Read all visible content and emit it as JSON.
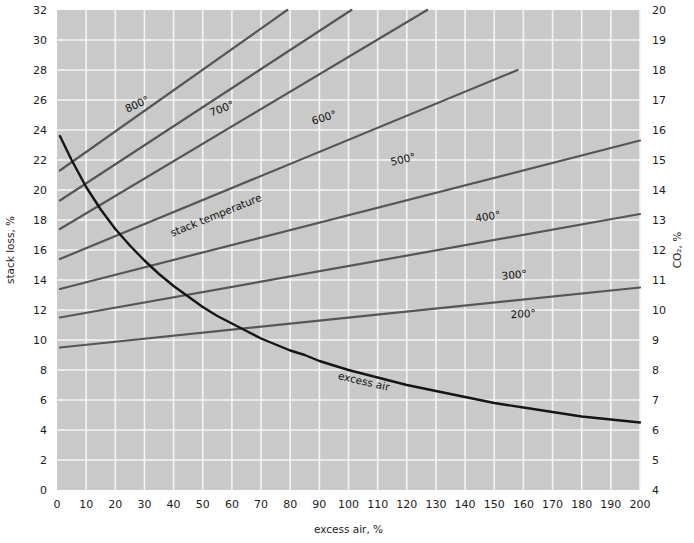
{
  "chart_data": {
    "type": "line",
    "title": "",
    "xlabel": "excess air, %",
    "ylabel": "stack loss, %",
    "y2label": "CO₂, %",
    "xlim": [
      0,
      200
    ],
    "ylim": [
      0,
      32
    ],
    "y2lim": [
      4,
      20
    ],
    "grid": true,
    "legend": "none",
    "background_color": "#c9c9c9",
    "grid_color": "#f4f4f4",
    "series_color": "#565656",
    "curve_color": "#151515",
    "xticks": [
      0,
      10,
      20,
      30,
      40,
      50,
      60,
      70,
      80,
      90,
      100,
      110,
      120,
      130,
      140,
      150,
      160,
      170,
      180,
      190,
      200
    ],
    "yticks": [
      0,
      2,
      4,
      6,
      8,
      10,
      12,
      14,
      16,
      18,
      20,
      22,
      24,
      26,
      28,
      30,
      32
    ],
    "y2ticks": [
      4,
      5,
      6,
      7,
      8,
      9,
      10,
      11,
      12,
      13,
      14,
      15,
      16,
      17,
      18,
      19,
      20
    ],
    "annotations": [
      {
        "text": "stack temperature",
        "x": 55,
        "y": 18.1,
        "rotation": -22
      },
      {
        "text": "excess air",
        "x": 105,
        "y": 7.0,
        "rotation": 13
      }
    ],
    "series": [
      {
        "name": "200°",
        "label": "200°",
        "label_x": 160,
        "label_y": 11.5,
        "label_rotation": -3,
        "x": [
          1,
          200
        ],
        "values": [
          9.5,
          13.5
        ]
      },
      {
        "name": "300°",
        "label": "300°",
        "label_x": 157,
        "label_y": 14.1,
        "label_rotation": -6,
        "x": [
          1,
          200
        ],
        "values": [
          11.5,
          18.4
        ]
      },
      {
        "name": "400°",
        "label": "400°",
        "label_x": 148,
        "label_y": 18.0,
        "label_rotation": -9,
        "x": [
          1,
          200
        ],
        "values": [
          13.4,
          23.3
        ]
      },
      {
        "name": "500°",
        "label": "500°",
        "label_x": 119,
        "label_y": 21.8,
        "label_rotation": -13,
        "x": [
          1,
          158
        ],
        "values": [
          15.4,
          28.0
        ]
      },
      {
        "name": "600°",
        "label": "600°",
        "label_x": 92,
        "label_y": 24.6,
        "label_rotation": -17,
        "x": [
          1,
          127
        ],
        "values": [
          17.4,
          32.0
        ]
      },
      {
        "name": "700°",
        "label": "700°",
        "label_x": 57,
        "label_y": 25.2,
        "label_rotation": -21,
        "x": [
          1,
          101
        ],
        "values": [
          19.3,
          32.0
        ]
      },
      {
        "name": "800°",
        "label": "800°",
        "label_x": 28,
        "label_y": 25.5,
        "label_rotation": -25,
        "x": [
          1,
          79
        ],
        "values": [
          21.3,
          32.0
        ]
      }
    ],
    "excess_air_curve": {
      "name": "excess air",
      "x": [
        1,
        5,
        10,
        15,
        20,
        25,
        30,
        35,
        40,
        45,
        50,
        55,
        60,
        65,
        70,
        75,
        80,
        85,
        90,
        95,
        100,
        110,
        120,
        130,
        140,
        150,
        160,
        170,
        180,
        190,
        200
      ],
      "values": [
        23.6,
        22.0,
        20.2,
        18.7,
        17.4,
        16.3,
        15.3,
        14.4,
        13.6,
        12.9,
        12.2,
        11.6,
        11.1,
        10.6,
        10.1,
        9.7,
        9.3,
        9.0,
        8.6,
        8.3,
        8.0,
        7.5,
        7.0,
        6.6,
        6.2,
        5.8,
        5.5,
        5.2,
        4.9,
        4.7,
        4.5
      ]
    }
  }
}
